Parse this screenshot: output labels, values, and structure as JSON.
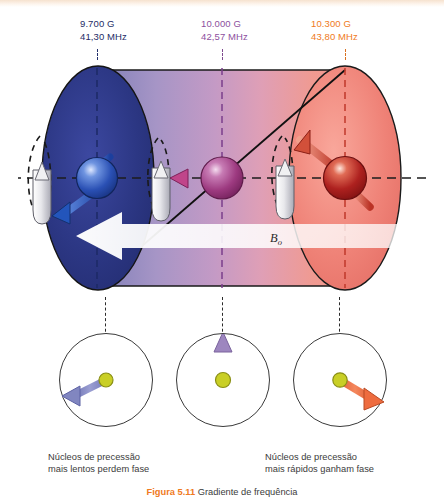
{
  "figure": {
    "title_number": "Figura 5.11",
    "title_text": "Gradiente de frequência",
    "background_color": "#ffffff"
  },
  "field_labels": [
    {
      "id": "low",
      "field": "9.700 G",
      "frequency": "41,30 MHz",
      "color": "#1d2c66"
    },
    {
      "id": "mid",
      "field": "10.000 G",
      "frequency": "42,57 MHz",
      "color": "#8d4f9e"
    },
    {
      "id": "high",
      "field": "10.300 G",
      "frequency": "43,80 MHz",
      "color": "#ef7a22"
    }
  ],
  "cylinder": {
    "b0_label": "B",
    "b0_subscript": "o",
    "gradient_start_color": "#232f73",
    "gradient_mid_color": "#b38fc4",
    "gradient_end_color": "#ef8a7e",
    "left_cap_color": "#2b3580",
    "right_cap_color": "#e8766c",
    "axis_color": "#222222"
  },
  "nuclei": [
    {
      "id": "low",
      "sphere_color": "#2a53b8",
      "arrow_color": "#2f63c4",
      "arrow_direction": "down-left"
    },
    {
      "id": "mid",
      "sphere_color": "#a03a86",
      "arrow_color": "#b8447f",
      "arrow_direction": "horizontal"
    },
    {
      "id": "high",
      "sphere_color": "#b3201e",
      "arrow_color": "#cf4537",
      "arrow_direction": "up-left"
    }
  ],
  "phase_circles": [
    {
      "id": "left",
      "arrow_color": "#8186c0",
      "dot_color": "#c9cf26",
      "arrow_direction": "down-left",
      "angle_deg": 200
    },
    {
      "id": "mid",
      "arrow_color": "#9d86bf",
      "dot_color": "#c9cf26",
      "arrow_direction": "up",
      "angle_deg": 90
    },
    {
      "id": "right",
      "arrow_color": "#ee6c3f",
      "dot_color": "#c9cf26",
      "arrow_direction": "down-right",
      "angle_deg": -32
    }
  ],
  "captions": {
    "left_line1": "Núcleos de precessão",
    "left_line2": "mais lentos perdem fase",
    "right_line1": "Núcleos de precessão",
    "right_line2": "mais rápidos ganham fase"
  }
}
